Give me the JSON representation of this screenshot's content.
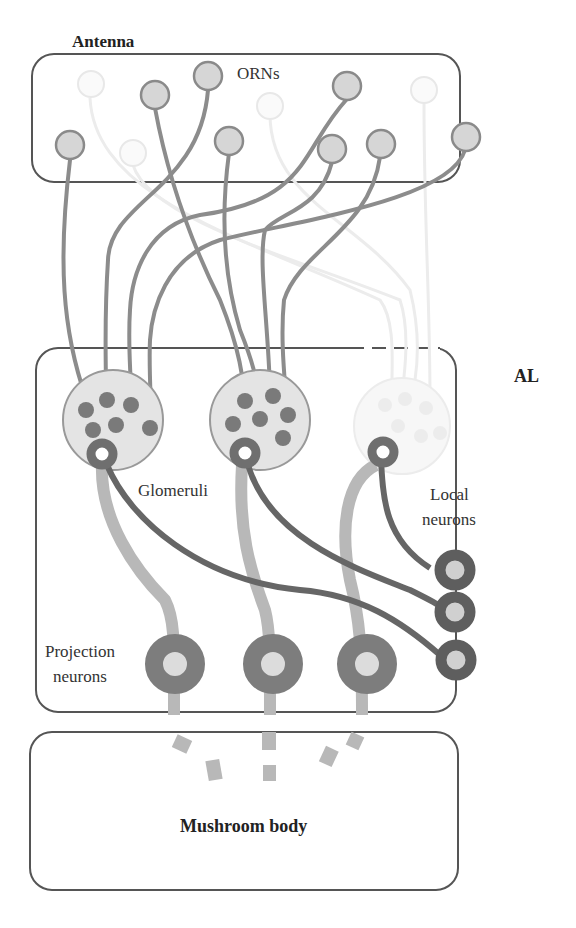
{
  "labels": {
    "antenna": "Antenna",
    "orns": "ORNs",
    "al": "AL",
    "glomeruli": "Glomeruli",
    "local_neurons_line1": "Local",
    "local_neurons_line2": "neurons",
    "projection_neurons_line1": "Projection",
    "projection_neurons_line2": "neurons",
    "mushroom_body": "Mushroom body"
  },
  "regions": [
    {
      "name": "Antenna",
      "contains": "ORNs"
    },
    {
      "name": "AL",
      "contains": [
        "Glomeruli",
        "Local neurons",
        "Projection neurons"
      ]
    },
    {
      "name": "Mushroom body"
    }
  ],
  "counts": {
    "orn_active": 9,
    "orn_faded": 4,
    "glomeruli": 3,
    "local_neurons": 3,
    "projection_neurons": 3
  },
  "colors": {
    "box_stroke": "#555555",
    "orn_fill": "#d4d4d4",
    "orn_stroke": "#8a8a8a",
    "axon": "#8c8c8c",
    "faded": "#ececec",
    "glomerulus_fill": "#e4e4e4",
    "glomerulus_dot": "#7a7a7a",
    "pn_ring": "#7d7d7d",
    "pn_axon": "#b8b8b8",
    "ln_ring": "#5e5e5e",
    "ln_neurite": "#666666"
  }
}
